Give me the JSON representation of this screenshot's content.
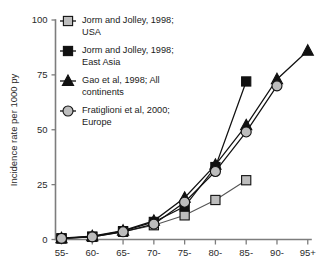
{
  "chart_data": {
    "type": "line",
    "title": "",
    "xlabel": "",
    "ylabel": "Incidence rate per 1000 py",
    "categories": [
      "55-",
      "60-",
      "65-",
      "70-",
      "75-",
      "80-",
      "85-",
      "90-",
      "95+"
    ],
    "xtick_labels": [
      "55-",
      "60-",
      "65-",
      "70-",
      "75-",
      "80-",
      "85-",
      "90-",
      "95+"
    ],
    "ytick_labels": [
      "0",
      "25",
      "50",
      "75",
      "100"
    ],
    "ytick_values": [
      0,
      25,
      50,
      75,
      100
    ],
    "ylim": [
      0,
      100
    ],
    "grid": false,
    "legend_position": "top-left",
    "series": [
      {
        "name": "Jorm and Jolley, 1998; USA",
        "label_line1": "Jorm and Jolley, 1998;",
        "label_line2": "USA",
        "marker": "square",
        "marker_fill": "#bdbdbd",
        "line_color": "#555555",
        "x": [
          "55-",
          "60-",
          "65-",
          "70-",
          "75-",
          "80-",
          "85-"
        ],
        "values": [
          0.5,
          1.2,
          3.5,
          6.5,
          11,
          18,
          27
        ]
      },
      {
        "name": "Jorm and Jolley, 1998; East Asia",
        "label_line1": "Jorm and Jolley, 1998;",
        "label_line2": "East Asia",
        "marker": "square",
        "marker_fill": "#111111",
        "line_color": "#111111",
        "x": [
          "55-",
          "60-",
          "65-",
          "70-",
          "75-",
          "80-",
          "85-"
        ],
        "values": [
          0.5,
          1.3,
          3.8,
          8.0,
          15,
          33,
          72
        ]
      },
      {
        "name": "Gao et al, 1998; All continents",
        "label_line1": "Gao et al, 1998; All",
        "label_line2": "continents",
        "marker": "triangle",
        "marker_fill": "#111111",
        "line_color": "#111111",
        "x": [
          "55-",
          "60-",
          "65-",
          "70-",
          "75-",
          "80-",
          "85-",
          "90-",
          "95+"
        ],
        "values": [
          0.6,
          1.5,
          4.0,
          8.5,
          19,
          34,
          52,
          73,
          86
        ]
      },
      {
        "name": "Fratiglioni et al, 2000; Europe",
        "label_line1": "Fratiglioni et al, 2000;",
        "label_line2": "Europe",
        "marker": "circle",
        "marker_fill": "#bdbdbd",
        "line_color": "#111111",
        "x": [
          "55-",
          "60-",
          "65-",
          "70-",
          "75-",
          "80-",
          "85-",
          "90-"
        ],
        "values": [
          0.5,
          1.2,
          3.5,
          7.0,
          17,
          31,
          49,
          70
        ]
      }
    ]
  },
  "colors": {
    "marker_gray": "#bdbdbd",
    "marker_black": "#111111",
    "axis": "#7d7d7d",
    "text": "#1a1a1a"
  }
}
